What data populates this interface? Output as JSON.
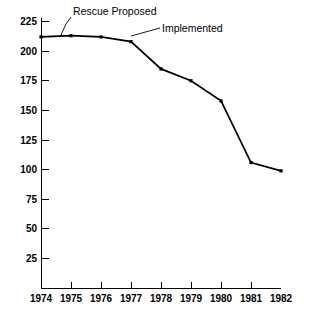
{
  "chart_data": {
    "type": "line",
    "title": "",
    "subtitle": "",
    "xlabel": "",
    "ylabel": "",
    "x": [
      1974,
      1975,
      1976,
      1977,
      1978,
      1979,
      1980,
      1981,
      1982
    ],
    "categories": [
      "1974",
      "1975",
      "1976",
      "1977",
      "1978",
      "1979",
      "1980",
      "1981",
      "1982"
    ],
    "values": [
      212,
      213,
      212,
      208,
      185,
      175,
      158,
      106,
      99
    ],
    "series": [
      {
        "name": "",
        "values": [
          212,
          213,
          212,
          208,
          185,
          175,
          158,
          106,
          99
        ]
      }
    ],
    "xlim": [
      1974,
      1982
    ],
    "ylim": [
      0,
      225
    ],
    "xticks": [
      "1974",
      "1975",
      "1976",
      "1977",
      "1978",
      "1979",
      "1980",
      "1981",
      "1982"
    ],
    "yticks": [
      "25",
      "50",
      "75",
      "100",
      "125",
      "150",
      "175",
      "200",
      "225"
    ],
    "ytick_values": [
      25,
      50,
      75,
      100,
      125,
      150,
      175,
      200,
      225
    ],
    "grid": false,
    "legend": false,
    "legend_position": "none",
    "markers": true,
    "line_color": "#000000",
    "annotations": [
      {
        "label": "Rescue Proposed",
        "points_to_x": 1975,
        "points_to_y": 213
      },
      {
        "label": "Implemented",
        "points_to_x": 1977,
        "points_to_y": 208
      }
    ]
  },
  "axes": {
    "y_tick_labels": [
      "225",
      "200",
      "175",
      "150",
      "125",
      "100",
      "75",
      "50",
      "25"
    ],
    "x_tick_labels": [
      "1974",
      "1975",
      "1976",
      "1977",
      "1978",
      "1979",
      "1980",
      "1981",
      "1982"
    ]
  },
  "annotations": {
    "rescue_proposed": "Rescue Proposed",
    "implemented": "Implemented"
  },
  "colors": {
    "line": "#000000",
    "axis": "#000000",
    "background": "#ffffff"
  }
}
